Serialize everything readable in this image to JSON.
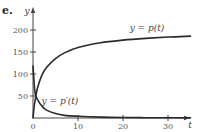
{
  "figure": {
    "part_label": "e."
  },
  "chart_data": {
    "type": "line",
    "title": "",
    "xlabel": "t",
    "ylabel": "y",
    "xlim": [
      0,
      37
    ],
    "ylim": [
      0,
      210
    ],
    "x_ticks": [
      0,
      10,
      20,
      30
    ],
    "y_ticks": [
      50,
      100,
      150,
      200
    ],
    "x_tick_labels": [
      "0",
      "10",
      "20",
      "30"
    ],
    "y_tick_labels": [
      "50",
      "100",
      "150",
      "200"
    ],
    "grid": false,
    "legend": "inline labels",
    "series": [
      {
        "name": "y = p(t)",
        "label": "y = p(t)",
        "x": [
          0,
          0.25,
          0.5,
          1,
          2,
          3,
          5,
          7,
          10,
          15,
          20,
          25,
          30,
          35
        ],
        "values": [
          0,
          25,
          42,
          68,
          98,
          115,
          135,
          148,
          160,
          171,
          177,
          181,
          184,
          186
        ]
      },
      {
        "name": "y = p'(t)",
        "label": "y = p′(t)",
        "x": [
          0,
          0.25,
          0.5,
          1,
          2,
          3,
          5,
          7,
          10,
          15,
          20,
          25,
          30,
          35
        ],
        "values": [
          118,
          80,
          55,
          42,
          27,
          18,
          10,
          6,
          4,
          2,
          1,
          0.7,
          0.5,
          0.3
        ]
      }
    ]
  }
}
